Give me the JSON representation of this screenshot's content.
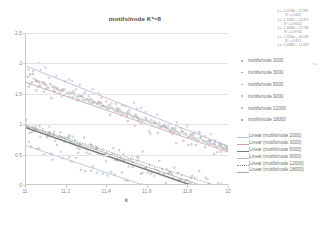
{
  "chart_data": {
    "type": "scatter",
    "title": "motifs/node K*=8",
    "xlabel": "k",
    "ylabel": "",
    "xlim": [
      11,
      12
    ],
    "ylim": [
      0,
      2.5
    ],
    "xticks": [
      "11",
      "11.2",
      "11.4",
      "11.6",
      "11.8",
      "12"
    ],
    "yticks": [
      "0",
      "0.5",
      "1",
      "1.5",
      "2",
      "2.5"
    ],
    "grid": true,
    "legend_position": "right",
    "series": [
      {
        "name": "motifs/node 2000",
        "color": "#9aa6c4",
        "marker": "dot",
        "trendline": {
          "slope": -1.1218,
          "intercept": 12.987,
          "r2": 0.842,
          "color": "#b0bcd6",
          "style": "solid",
          "width": 0.8
        },
        "x": [
          11.02,
          11.05,
          11.08,
          11.12,
          11.17,
          11.21,
          11.26,
          11.3,
          11.35,
          11.39,
          11.44,
          11.48,
          11.53,
          11.57,
          11.62,
          11.66,
          11.71,
          11.75,
          11.8,
          11.84,
          11.89,
          11.93,
          11.97
        ],
        "y": [
          1.82,
          1.72,
          1.69,
          1.66,
          1.55,
          1.52,
          1.46,
          1.41,
          1.33,
          1.29,
          1.22,
          1.18,
          1.12,
          1.07,
          1.0,
          0.96,
          0.9,
          0.86,
          0.79,
          0.75,
          0.7,
          0.66,
          0.61
        ]
      },
      {
        "name": "motifs/node 3000",
        "color": "#c49a9a",
        "marker": "dot",
        "trendline": {
          "slope": -1.1531,
          "intercept": 14.372,
          "r2": 0.9014,
          "color": "#c9a2a2",
          "style": "solid",
          "width": 0.8
        },
        "x": [
          11.01,
          11.06,
          11.1,
          11.15,
          11.19,
          11.24,
          11.28,
          11.33,
          11.37,
          11.42,
          11.46,
          11.51,
          11.55,
          11.6,
          11.64,
          11.69,
          11.73,
          11.78,
          11.82,
          11.87,
          11.91,
          11.96,
          11.99
        ],
        "y": [
          1.78,
          1.7,
          1.64,
          1.59,
          1.57,
          1.49,
          1.44,
          1.38,
          1.35,
          1.27,
          1.24,
          1.17,
          1.1,
          1.05,
          1.01,
          0.95,
          0.88,
          0.84,
          0.78,
          0.73,
          0.68,
          0.63,
          0.59
        ]
      },
      {
        "name": "motifs/node 5000",
        "color": "#9ab58a",
        "marker": "dot",
        "trendline": {
          "slope": -1.1606,
          "intercept": 13.708,
          "r2": 0.9703,
          "color": "#7b7b7b",
          "style": "solid",
          "width": 1.5
        },
        "x": [
          11.03,
          11.07,
          11.11,
          11.16,
          11.2,
          11.25,
          11.29,
          11.34,
          11.38,
          11.43,
          11.47,
          11.52,
          11.56,
          11.61,
          11.65,
          11.7,
          11.74,
          11.79,
          11.83,
          11.88,
          11.92,
          11.95,
          11.98
        ],
        "y": [
          1.69,
          1.64,
          1.6,
          1.56,
          1.5,
          1.45,
          1.4,
          1.36,
          1.3,
          1.25,
          1.2,
          1.14,
          1.09,
          1.03,
          0.99,
          0.93,
          0.88,
          0.83,
          0.77,
          0.72,
          0.67,
          0.64,
          0.6
        ]
      },
      {
        "name": "motifs/node 9000",
        "color": "#b8a8c8",
        "marker": "dot",
        "trendline": {
          "slope": -1.3254,
          "intercept": 16.535,
          "r2": 0.923,
          "color": "#bcaed0",
          "style": "solid",
          "width": 0.8
        },
        "x": [
          11.04,
          11.09,
          11.13,
          11.18,
          11.22,
          11.27,
          11.31,
          11.36,
          11.4,
          11.45,
          11.49,
          11.54,
          11.58,
          11.63,
          11.67,
          11.72,
          11.76,
          11.81,
          11.85,
          11.9,
          11.94,
          11.97,
          11.99
        ],
        "y": [
          1.75,
          1.68,
          1.62,
          1.55,
          1.52,
          1.46,
          1.4,
          1.34,
          1.28,
          1.23,
          1.17,
          1.12,
          1.06,
          1.0,
          0.95,
          0.9,
          0.84,
          0.79,
          0.73,
          0.68,
          0.63,
          0.6,
          0.57
        ]
      },
      {
        "name": "motifs/node 12000",
        "color": "#8fb8c9",
        "marker": "dot",
        "trendline": {
          "slope": -1.0589,
          "intercept": 12.629,
          "r2": 0.938,
          "color": "#8a8a8a",
          "style": "dotted",
          "width": 0.8
        },
        "x": [
          11.02,
          11.06,
          11.1,
          11.14,
          11.19,
          11.23,
          11.28,
          11.32,
          11.37,
          11.41,
          11.46,
          11.5,
          11.55,
          11.59,
          11.64,
          11.68,
          11.73,
          11.77,
          11.82,
          11.86,
          11.91,
          11.95,
          11.98
        ],
        "y": [
          1.66,
          1.62,
          1.58,
          1.53,
          1.48,
          1.44,
          1.39,
          1.35,
          1.3,
          1.26,
          1.21,
          1.16,
          1.11,
          1.07,
          1.02,
          0.97,
          0.92,
          0.88,
          0.82,
          0.78,
          0.73,
          0.69,
          0.65
        ]
      },
      {
        "name": "motifs/node 18000",
        "color": "#a0a0a0",
        "marker": "dot",
        "trendline": {
          "slope": -1.1344,
          "intercept": 13.451,
          "r2": 0.951,
          "color": "#a8a8a8",
          "style": "solid",
          "width": 0.8
        },
        "x": [
          11.05,
          11.09,
          11.14,
          11.18,
          11.23,
          11.27,
          11.32,
          11.36,
          11.41,
          11.45,
          11.5,
          11.54,
          11.59,
          11.63,
          11.68,
          11.72,
          11.77,
          11.81,
          11.86,
          11.9,
          11.93,
          11.96,
          11.99
        ],
        "y": [
          1.71,
          1.66,
          1.61,
          1.57,
          1.51,
          1.47,
          1.41,
          1.37,
          1.31,
          1.26,
          1.2,
          1.15,
          1.1,
          1.04,
          0.99,
          0.94,
          0.88,
          0.83,
          0.78,
          0.73,
          0.7,
          0.66,
          0.62
        ]
      }
    ],
    "scatter_cloud_note": "dense noisy cloud around each trendline",
    "equations": [
      {
        "eq": "y = -1.1218x + 12.987",
        "r2": "R² = 0.842"
      },
      {
        "eq": "y = -1.1531x + 14.372",
        "r2": "R² = 0.9014"
      },
      {
        "eq": "y = -1.1606x + 13.708",
        "r2": "R² = 0.9703"
      },
      {
        "eq": "y = -1.3254x + 16.535",
        "r2": "R² = 0.923"
      },
      {
        "eq": "y = -1.0589x + 12.629",
        "r2": ""
      }
    ]
  },
  "legend": {
    "marker_entries": [
      {
        "label": "motifs/node 2000",
        "color": "#9aa6c4"
      },
      {
        "label": "motifs/node 3000",
        "color": "#c49a9a"
      },
      {
        "label": "motifs/node 5000",
        "color": "#9ab58a"
      },
      {
        "label": "motifs/node 9000",
        "color": "#b8a8c8"
      },
      {
        "label": "motifs/node 12000",
        "color": "#8fb8c9"
      },
      {
        "label": "motifs/node 18000",
        "color": "#a0a0a0"
      }
    ],
    "line_entries": [
      {
        "label": "Linear (motifs/node 2000)",
        "color": "#b0bcd6",
        "style": "solid",
        "width": 0.8
      },
      {
        "label": "Linear (motifs/node 3000)",
        "color": "#c9a2a2",
        "style": "solid",
        "width": 0.8
      },
      {
        "label": "Linear (motifs/node 5000)",
        "color": "#7b7b7b",
        "style": "solid",
        "width": 1.6
      },
      {
        "label": "Linear (motifs/node 9000)",
        "color": "#bcaed0",
        "style": "solid",
        "width": 0.8
      },
      {
        "label": "Linear (motifs/node 12000)",
        "color": "#8a8a8a",
        "style": "dotted",
        "width": 0.9
      },
      {
        "label": "Linear (motifs/node 18000)",
        "color": "#a8a8a8",
        "style": "solid",
        "width": 0.8
      }
    ]
  },
  "side_note": "n="
}
